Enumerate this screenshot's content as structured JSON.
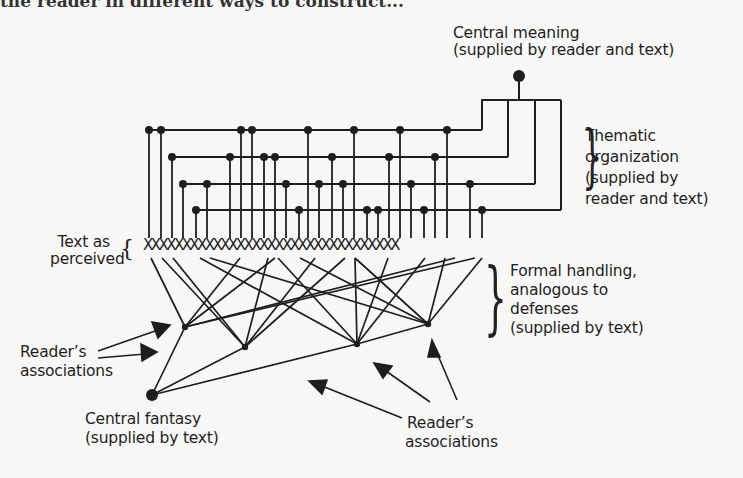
{
  "page": {
    "cut_text": "the reader in different ways to construct..."
  },
  "labels": {
    "central_meaning": [
      "Central meaning",
      "(supplied by reader and text)"
    ],
    "thematic": [
      "Thematic",
      "organization",
      "(supplied by",
      "reader and text)"
    ],
    "text_as_perceived": [
      "Text as",
      "perceived"
    ],
    "formal_handling": [
      "Formal handling,",
      "analogous to",
      "defenses",
      "(supplied by text)"
    ],
    "readers_assoc_left": [
      "Reader’s",
      "associations"
    ],
    "central_fantasy": [
      "Central fantasy",
      "(supplied by text)"
    ],
    "readers_assoc_bottom": [
      "Reader’s",
      "associations"
    ]
  },
  "text_row": "XXXXXXXXXXXXXXXXXXXXXXXXXXXXXXXXX",
  "diagram": {
    "central_meaning_node": {
      "x": 519,
      "y": 77
    },
    "thematic_rows": [
      {
        "y": 130,
        "end_x": 482,
        "nodes": [
          149,
          161,
          241,
          252,
          308,
          354,
          400,
          447
        ]
      },
      {
        "y": 157,
        "end_x": 508,
        "nodes": [
          172,
          230,
          264,
          275,
          332,
          389,
          435
        ]
      },
      {
        "y": 184,
        "end_x": 535,
        "nodes": [
          183,
          207,
          286,
          319,
          343,
          411,
          470
        ]
      },
      {
        "y": 210,
        "end_x": 561,
        "nodes": [
          196,
          299,
          367,
          378,
          424,
          482
        ]
      }
    ],
    "central_fantasy_node": {
      "x": 152,
      "y": 395
    },
    "defense_nodes": [
      {
        "id": "A",
        "x": 185,
        "y": 327
      },
      {
        "id": "B",
        "x": 245,
        "y": 347
      },
      {
        "id": "C",
        "x": 357,
        "y": 344
      },
      {
        "id": "D",
        "x": 428,
        "y": 324
      }
    ]
  }
}
